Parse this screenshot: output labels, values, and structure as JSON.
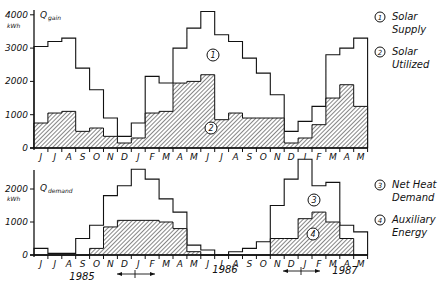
{
  "chart_data": [
    {
      "type": "bar",
      "title": "Q gain",
      "ylabel": "kWh",
      "ylim": [
        0,
        4000
      ],
      "yticks": [
        0,
        1000,
        2000,
        3000,
        4000
      ],
      "categories": [
        "J",
        "J",
        "A",
        "S",
        "O",
        "N",
        "D",
        "J",
        "F",
        "M",
        "A",
        "M",
        "J",
        "J",
        "A",
        "S",
        "O",
        "N",
        "D",
        "J",
        "F",
        "M",
        "A",
        "M"
      ],
      "series": [
        {
          "name": "Solar Supply",
          "marker": "1",
          "style": "outline",
          "values": [
            3050,
            3200,
            3300,
            2400,
            1750,
            900,
            350,
            750,
            2150,
            1950,
            3000,
            3600,
            4100,
            3400,
            3200,
            2700,
            2250,
            1600,
            500,
            800,
            1250,
            2800,
            3000,
            3300
          ]
        },
        {
          "name": "Solar Utilized",
          "marker": "2",
          "style": "hatched",
          "values": [
            750,
            1050,
            1100,
            500,
            600,
            350,
            150,
            300,
            1050,
            1100,
            1950,
            2000,
            2200,
            850,
            1050,
            900,
            900,
            900,
            150,
            300,
            700,
            1500,
            1900,
            1250
          ]
        }
      ],
      "legend": [
        {
          "num": "1",
          "lines": [
            "Solar",
            "Supply"
          ]
        },
        {
          "num": "2",
          "lines": [
            "Solar",
            "Utilized"
          ]
        }
      ]
    },
    {
      "type": "bar",
      "title": "Q demand",
      "ylabel": "kWh",
      "ylim": [
        0,
        2000
      ],
      "yticks": [
        0,
        1000,
        2000
      ],
      "categories": [
        "J",
        "J",
        "A",
        "S",
        "O",
        "N",
        "D",
        "J",
        "F",
        "M",
        "A",
        "M",
        "J",
        "J",
        "A",
        "S",
        "O",
        "N",
        "D",
        "J",
        "F",
        "M",
        "A",
        "M"
      ],
      "series": [
        {
          "name": "Net Heat Demand",
          "marker": "3",
          "style": "outline",
          "values": [
            200,
            50,
            50,
            500,
            900,
            1800,
            2100,
            2600,
            2300,
            1700,
            1300,
            300,
            150,
            0,
            100,
            200,
            400,
            1500,
            2300,
            2900,
            2100,
            2200,
            900,
            700
          ]
        },
        {
          "name": "Auxiliary Energy",
          "marker": "4",
          "style": "hatched",
          "values": [
            0,
            0,
            0,
            0,
            200,
            850,
            1050,
            1050,
            1050,
            1000,
            800,
            100,
            0,
            0,
            0,
            0,
            0,
            500,
            500,
            1100,
            1300,
            1000,
            500,
            0
          ]
        }
      ],
      "legend": [
        {
          "num": "3",
          "lines": [
            "Net Heat",
            "Demand"
          ]
        },
        {
          "num": "4",
          "lines": [
            "Auxiliary",
            "Energy"
          ]
        }
      ],
      "years": [
        "1985",
        "1986",
        "1987"
      ]
    }
  ],
  "top": {
    "title_q": "Q",
    "title_sub": "gain",
    "unit": "kWh",
    "yticks": [
      "4000",
      "3000",
      "2000",
      "1000",
      "0"
    ]
  },
  "bottom": {
    "title_q": "Q",
    "title_sub": "demand",
    "unit": "kWh",
    "yticks": [
      "2000",
      "1000",
      "0"
    ]
  }
}
